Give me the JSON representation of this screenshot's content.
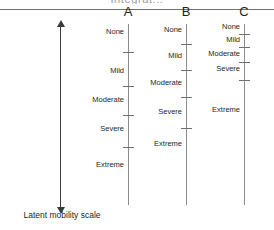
{
  "figure": {
    "running_title": "Integrat...",
    "latent_axis": {
      "caption": "Latent mobility scale",
      "arrow": "double-headed-vertical-arrow"
    },
    "scales": [
      {
        "id": "A",
        "header": "A",
        "categories": [
          {
            "label": "None",
            "pos": 32
          },
          {
            "label": "Mild",
            "pos": 71
          },
          {
            "label": "Moderate",
            "pos": 100
          },
          {
            "label": "Severe",
            "pos": 129
          },
          {
            "label": "Extreme",
            "pos": 165
          }
        ],
        "thresholds": [
          52,
          86,
          115,
          147
        ],
        "axis_top": 24,
        "axis_bottom": 205
      },
      {
        "id": "B",
        "header": "B",
        "categories": [
          {
            "label": "None",
            "pos": 30
          },
          {
            "label": "Mild",
            "pos": 56
          },
          {
            "label": "Moderate",
            "pos": 83
          },
          {
            "label": "Severe",
            "pos": 112
          },
          {
            "label": "Extreme",
            "pos": 144
          }
        ],
        "thresholds": [
          44,
          70,
          97,
          128
        ],
        "axis_top": 24,
        "axis_bottom": 205
      },
      {
        "id": "C",
        "header": "C",
        "categories": [
          {
            "label": "None",
            "pos": 27
          },
          {
            "label": "Mild",
            "pos": 40
          },
          {
            "label": "Moderate",
            "pos": 54
          },
          {
            "label": "Severe",
            "pos": 69
          },
          {
            "label": "Extreme",
            "pos": 110
          }
        ],
        "thresholds": [
          34,
          47,
          62,
          80
        ],
        "axis_top": 24,
        "axis_bottom": 205
      }
    ]
  },
  "chart_data": {
    "type": "diagram",
    "ylabel": "Latent mobility scale",
    "ylim": [
      0,
      1
    ],
    "grid": false,
    "legend": null,
    "annotations": [
      "Latent mobility scale"
    ],
    "series": [
      {
        "name": "A",
        "categories": [
          "None",
          "Mild",
          "Moderate",
          "Severe",
          "Extreme"
        ],
        "threshold_count": 4
      },
      {
        "name": "B",
        "categories": [
          "None",
          "Mild",
          "Moderate",
          "Severe",
          "Extreme"
        ],
        "threshold_count": 4
      },
      {
        "name": "C",
        "categories": [
          "None",
          "Mild",
          "Moderate",
          "Severe",
          "Extreme"
        ],
        "threshold_count": 4
      }
    ]
  }
}
